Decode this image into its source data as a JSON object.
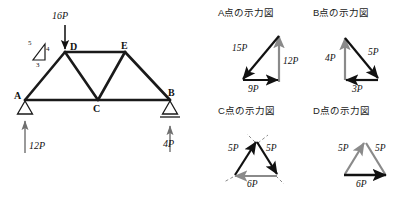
{
  "figure": {
    "truss": {
      "nodes": [
        {
          "id": "A",
          "label": "A",
          "x": 25,
          "y": 100
        },
        {
          "id": "D",
          "label": "D",
          "x": 65,
          "y": 52
        },
        {
          "id": "E",
          "label": "E",
          "x": 125,
          "y": 52
        },
        {
          "id": "B",
          "label": "B",
          "x": 170,
          "y": 100
        },
        {
          "id": "C",
          "label": "C",
          "x": 98,
          "y": 100
        }
      ],
      "applied_load": {
        "label": "16P",
        "value": 16,
        "unit": "P",
        "at_node": "D",
        "direction": "down"
      },
      "reactions": [
        {
          "label": "12P",
          "value": 12,
          "unit": "P",
          "at_node": "A",
          "direction": "up",
          "support": "pin"
        },
        {
          "label": "4P",
          "value": 4,
          "unit": "P",
          "at_node": "B",
          "direction": "up",
          "support": "roller"
        }
      ],
      "slope_triangle": {
        "hypotenuse": "5",
        "vertical": "4",
        "base": "3"
      }
    },
    "panels": [
      {
        "id": "A",
        "title": "A点の示力図",
        "vectors": [
          {
            "label": "15P",
            "value": 15,
            "color": "#111111"
          },
          {
            "label": "12P",
            "value": 12,
            "color": "#8a8a8a"
          },
          {
            "label": "9P",
            "value": 9,
            "color": "#111111"
          }
        ]
      },
      {
        "id": "B",
        "title": "B点の示力図",
        "vectors": [
          {
            "label": "4P",
            "value": 4,
            "color": "#8a8a8a"
          },
          {
            "label": "5P",
            "value": 5,
            "color": "#111111"
          },
          {
            "label": "3P",
            "value": 3,
            "color": "#111111"
          }
        ]
      },
      {
        "id": "C",
        "title": "C点の示力図",
        "vectors": [
          {
            "label": "5P",
            "value": 5,
            "color": "#111111"
          },
          {
            "label": "5P",
            "value": 5,
            "color": "#111111"
          },
          {
            "label": "6P",
            "value": 6,
            "color": "#8a8a8a"
          }
        ]
      },
      {
        "id": "D",
        "title": "D点の示力図",
        "vectors": [
          {
            "label": "5P",
            "value": 5,
            "color": "#8a8a8a"
          },
          {
            "label": "5P",
            "value": 5,
            "color": "#8a8a8a"
          },
          {
            "label": "6P",
            "value": 6,
            "color": "#111111"
          }
        ]
      }
    ],
    "colors": {
      "member": "#1a1a1a",
      "gray_vector": "#8a8a8a",
      "black_vector": "#111111",
      "background": "#ffffff"
    }
  }
}
